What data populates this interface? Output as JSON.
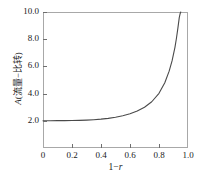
{
  "chart_data": {
    "type": "line",
    "title": "",
    "xlabel": "1−r",
    "xlabel_parts": {
      "prefix": "1−",
      "italic": "r"
    },
    "ylabel": "A(流量−比转)",
    "ylabel_parts": {
      "italic": "A",
      "rest": "(流量−比转)"
    },
    "xlim": [
      0,
      1.0
    ],
    "ylim": [
      0,
      10.0
    ],
    "grid": false,
    "legend": false,
    "line_color": "#4a4a4a",
    "frame_color": "#a8a8a8",
    "xticks": [
      {
        "value": 0,
        "label": "0"
      },
      {
        "value": 0.2,
        "label": "0.2"
      },
      {
        "value": 0.4,
        "label": "0.4"
      },
      {
        "value": 0.6,
        "label": "0.6"
      },
      {
        "value": 0.8,
        "label": "0.8"
      },
      {
        "value": 1.0,
        "label": "1.0"
      }
    ],
    "yticks": [
      {
        "value": 2.0,
        "label": "2.0"
      },
      {
        "value": 4.0,
        "label": "4.0"
      },
      {
        "value": 6.0,
        "label": "6.0"
      },
      {
        "value": 8.0,
        "label": "8.0"
      },
      {
        "value": 10.0,
        "label": "10.0"
      }
    ],
    "series": [
      {
        "name": "A",
        "x": [
          0.0,
          0.05,
          0.1,
          0.15,
          0.2,
          0.25,
          0.3,
          0.35,
          0.4,
          0.45,
          0.5,
          0.55,
          0.6,
          0.65,
          0.7,
          0.75,
          0.8,
          0.84,
          0.87,
          0.89,
          0.91,
          0.92,
          0.93,
          0.94,
          0.945,
          0.95
        ],
        "y": [
          2.0,
          2.0,
          2.01,
          2.01,
          2.02,
          2.03,
          2.05,
          2.08,
          2.12,
          2.18,
          2.26,
          2.37,
          2.52,
          2.72,
          3.0,
          3.4,
          4.02,
          4.8,
          5.65,
          6.4,
          7.4,
          8.05,
          8.8,
          9.6,
          9.85,
          10.0
        ]
      }
    ]
  }
}
